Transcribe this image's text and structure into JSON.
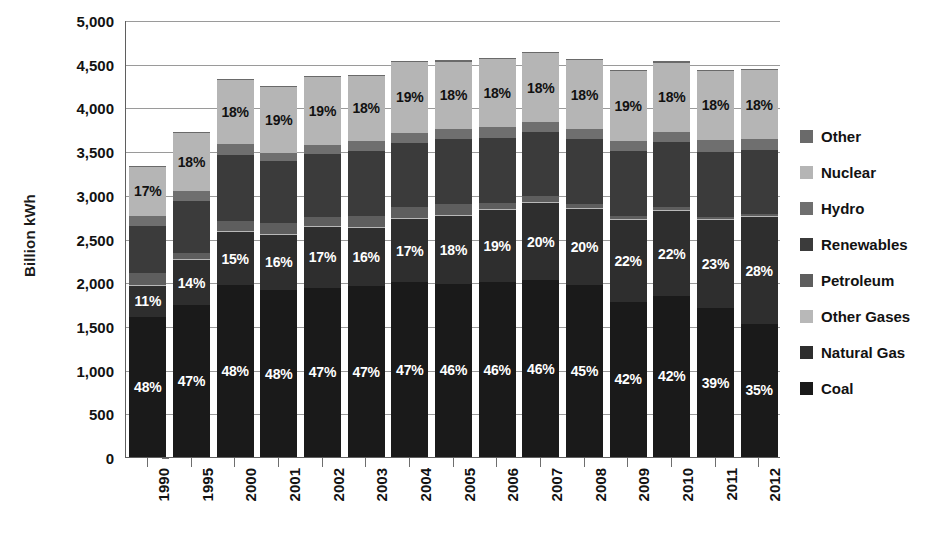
{
  "chart_data": {
    "type": "bar",
    "stacked": true,
    "title": "",
    "xlabel": "",
    "ylabel": "Billion kWh",
    "ylim": [
      0,
      5000
    ],
    "ytick_step": 500,
    "grid": true,
    "legend_position": "right",
    "categories": [
      "1990",
      "1995",
      "2000",
      "2001",
      "2002",
      "2003",
      "2004",
      "2005",
      "2006",
      "2007",
      "2008",
      "2009",
      "2010",
      "2011",
      "2012"
    ],
    "totals": [
      3330,
      3690,
      4090,
      3980,
      4120,
      4160,
      4250,
      4310,
      4350,
      4400,
      4370,
      4230,
      4390,
      4370,
      4350
    ],
    "series": [
      {
        "name": "Coal",
        "color": "#1a1a1a",
        "values": [
          1598,
          1734,
          1963,
          1910,
          1936,
          1955,
          1998,
          1983,
          2001,
          2024,
          1967,
          1776,
          1844,
          1704,
          1523
        ],
        "labels": [
          "48%",
          "47%",
          "48%",
          "48%",
          "47%",
          "47%",
          "47%",
          "46%",
          "46%",
          "46%",
          "45%",
          "42%",
          "42%",
          "39%",
          "35%"
        ]
      },
      {
        "name": "Natural Gas",
        "color": "#2e2e2e",
        "values": [
          366,
          517,
          614,
          637,
          700,
          666,
          723,
          776,
          827,
          880,
          874,
          931,
          966,
          1005,
          1218
        ],
        "labels": [
          "11%",
          "14%",
          "15%",
          "16%",
          "17%",
          "16%",
          "17%",
          "18%",
          "19%",
          "20%",
          "20%",
          "22%",
          "22%",
          "23%",
          "28%"
        ]
      },
      {
        "name": "Other Gases",
        "color": "#b8b8b8",
        "values": [
          10,
          14,
          14,
          10,
          11,
          15,
          16,
          14,
          15,
          14,
          12,
          11,
          11,
          12,
          12
        ],
        "labels": [
          "",
          "",
          "",
          "",
          "",
          "",
          "",
          "",
          "",
          "",
          "",
          "",
          "",
          "",
          ""
        ]
      },
      {
        "name": "Petroleum",
        "color": "#5e5e5e",
        "values": [
          127,
          74,
          111,
          125,
          95,
          119,
          121,
          122,
          64,
          65,
          46,
          39,
          37,
          30,
          23
        ],
        "labels": [
          "",
          "",
          "",
          "",
          "",
          "",
          "",
          "",
          "",
          "",
          "",
          "",
          "",
          "",
          ""
        ]
      },
      {
        "name": "Renewables",
        "color": "#3b3b3b",
        "values": [
          545,
          586,
          753,
          701,
          723,
          742,
          738,
          739,
          743,
          741,
          743,
          740,
          744,
          735,
          736
        ],
        "labels": [
          "",
          "",
          "",
          "",
          "",
          "",
          "",
          "",
          "",
          "",
          "",
          "",
          "",
          "",
          ""
        ]
      },
      {
        "name": "Hydro",
        "color": "#6f6f6f",
        "values": [
          113,
          122,
          125,
          96,
          103,
          117,
          114,
          116,
          121,
          106,
          110,
          116,
          121,
          142,
          129
        ],
        "labels": [
          "",
          "",
          "",
          "",
          "",
          "",
          "",
          "",
          "",
          "",
          "",
          "",
          "",
          "",
          ""
        ]
      },
      {
        "name": "Nuclear",
        "color": "#b5b5b5",
        "values": [
          566,
          664,
          736,
          757,
          783,
          749,
          808,
          775,
          783,
          792,
          787,
          803,
          790,
          790,
          783
        ],
        "labels": [
          "17%",
          "18%",
          "18%",
          "19%",
          "19%",
          "18%",
          "19%",
          "18%",
          "18%",
          "18%",
          "18%",
          "19%",
          "18%",
          "18%",
          "18%"
        ]
      },
      {
        "name": "Other",
        "color": "#6a6a6a",
        "values": [
          5,
          9,
          14,
          12,
          12,
          13,
          14,
          13,
          14,
          14,
          13,
          13,
          14,
          14,
          14
        ],
        "labels": [
          "",
          "",
          "",
          "",
          "",
          "",
          "",
          "",
          "",
          "",
          "",
          "",
          "",
          "",
          ""
        ]
      }
    ],
    "y_tick_labels": [
      "5,000",
      "4,500",
      "4,000",
      "3,500",
      "3,000",
      "2,500",
      "2,000",
      "1,500",
      "1,000",
      "500",
      "0"
    ],
    "legend": [
      {
        "label": "Other",
        "color": "#6a6a6a"
      },
      {
        "label": "Nuclear",
        "color": "#b5b5b5"
      },
      {
        "label": "Hydro",
        "color": "#6f6f6f"
      },
      {
        "label": "Renewables",
        "color": "#3b3b3b"
      },
      {
        "label": "Petroleum",
        "color": "#5e5e5e"
      },
      {
        "label": "Other Gases",
        "color": "#b8b8b8"
      },
      {
        "label": "Natural Gas",
        "color": "#2e2e2e"
      },
      {
        "label": "Coal",
        "color": "#1a1a1a"
      }
    ]
  }
}
